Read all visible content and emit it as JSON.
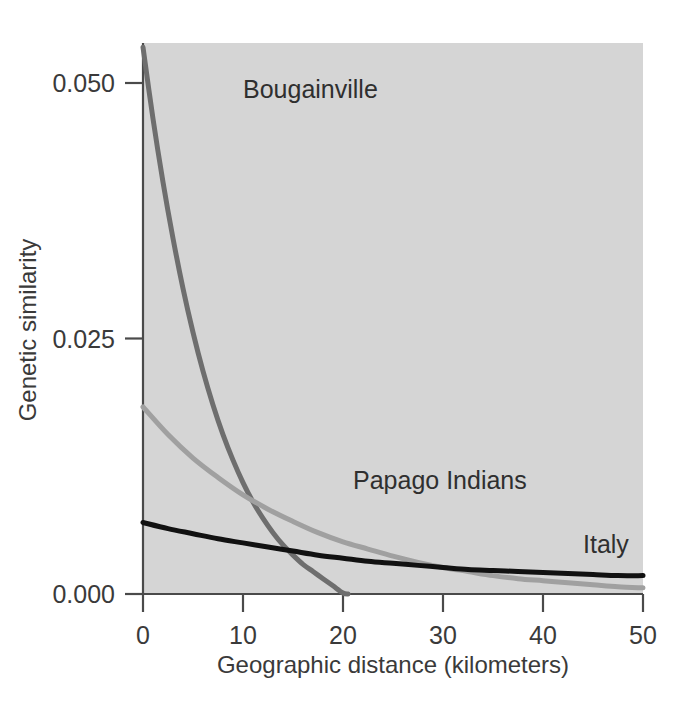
{
  "chart_data": {
    "type": "line",
    "title": "",
    "xlabel": "Geographic distance (kilometers)",
    "ylabel": "Genetic similarity",
    "xlim": [
      0,
      50
    ],
    "ylim": [
      0.0,
      0.054
    ],
    "xticks": [
      "0",
      "10",
      "20",
      "30",
      "40",
      "50"
    ],
    "xtick_values": [
      0,
      10,
      20,
      30,
      40,
      50
    ],
    "yticks": [
      "0.000",
      "0.025",
      "0.050"
    ],
    "ytick_values": [
      0.0,
      0.025,
      0.05
    ],
    "grid": false,
    "legend": "inline-labels",
    "plot_background": "#d5d5d5",
    "series": [
      {
        "name": "Bougainville",
        "color": "#6e6e6e",
        "linewidth": 5,
        "label_x": 10,
        "label_y": 0.0485,
        "x": [
          0,
          1,
          2,
          3,
          4,
          5,
          6,
          7,
          8,
          9,
          10,
          11,
          12,
          13,
          14,
          15,
          16,
          17,
          18,
          19,
          20,
          20.5
        ],
        "values": [
          0.0535,
          0.0465,
          0.0403,
          0.0348,
          0.0299,
          0.0256,
          0.0218,
          0.0185,
          0.0156,
          0.0131,
          0.0109,
          0.009,
          0.0074,
          0.006,
          0.0048,
          0.0038,
          0.0029,
          0.0022,
          0.0015,
          0.0008,
          0.0001,
          0.0
        ]
      },
      {
        "name": "Papago Indians",
        "color": "#a0a0a0",
        "linewidth": 5,
        "label_x": 21,
        "label_y": 0.0103,
        "x": [
          0,
          2.5,
          5,
          7.5,
          10,
          12.5,
          15,
          17.5,
          20,
          22.5,
          25,
          27.5,
          30,
          32.5,
          35,
          37.5,
          40,
          42.5,
          45,
          47.5,
          50
        ],
        "values": [
          0.0183,
          0.0156,
          0.0133,
          0.0114,
          0.0097,
          0.0083,
          0.0071,
          0.006,
          0.0051,
          0.0044,
          0.0037,
          0.0031,
          0.0026,
          0.0022,
          0.0018,
          0.0015,
          0.0013,
          0.0011,
          0.0009,
          0.0007,
          0.0006
        ]
      },
      {
        "name": "Italy",
        "color": "#111111",
        "linewidth": 5,
        "label_x": 44,
        "label_y": 0.004,
        "x": [
          0,
          2.5,
          5,
          7.5,
          10,
          12.5,
          15,
          17.5,
          20,
          22.5,
          25,
          27.5,
          30,
          32.5,
          35,
          37.5,
          40,
          42.5,
          45,
          47.5,
          50
        ],
        "values": [
          0.007,
          0.0064,
          0.0059,
          0.0054,
          0.005,
          0.0046,
          0.0042,
          0.0038,
          0.0035,
          0.0032,
          0.003,
          0.0028,
          0.0026,
          0.0024,
          0.0023,
          0.0022,
          0.0021,
          0.002,
          0.0019,
          0.0018,
          0.0018
        ]
      }
    ]
  }
}
